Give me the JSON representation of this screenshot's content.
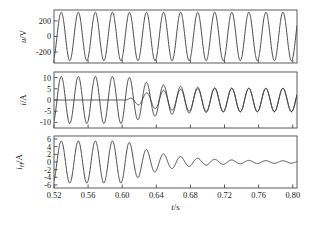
{
  "figure": {
    "background_color": "#ffffff",
    "axis_color": "#4a4a4a",
    "curve_color": "#3c3c3c",
    "text_color": "#1a1a1a",
    "xlabel": "t/s",
    "xlabel_italic": "t",
    "xlabel_rest": "/s"
  },
  "chart_data": [
    {
      "type": "line",
      "panel": 1,
      "title": "",
      "ylabel": "u/V",
      "ylabel_italic": "u",
      "ylabel_rest": "/V",
      "xlabel": "",
      "xlim": [
        0.52,
        0.805
      ],
      "ylim": [
        -340,
        340
      ],
      "yticks": [
        200,
        0,
        -200
      ],
      "ytick_labels": [
        "200",
        "0",
        "-200"
      ],
      "xticks": [
        0.52,
        0.56,
        0.6,
        0.64,
        0.68,
        0.72,
        0.76,
        0.8
      ],
      "xtick_labels": [
        "",
        "",
        "",
        "",
        "",
        "",
        "",
        ""
      ],
      "grid": false,
      "legend": null,
      "series": [
        {
          "name": "u",
          "description": "constant-amplitude 50 Hz sinusoidal supply voltage",
          "waveform": "sine",
          "amplitude": 311,
          "frequency_hz": 50,
          "phase_rad": -1.1,
          "offset": 0
        }
      ]
    },
    {
      "type": "line",
      "panel": 2,
      "title": "",
      "ylabel": "i/A",
      "ylabel_italic": "i",
      "ylabel_rest": "/A",
      "xlabel": "",
      "xlim": [
        0.52,
        0.805
      ],
      "ylim": [
        -12.5,
        12.5
      ],
      "yticks": [
        10,
        5,
        0,
        -5,
        -10
      ],
      "ytick_labels": [
        "10",
        "5",
        "0",
        "-5",
        "-10"
      ],
      "xticks": [
        0.52,
        0.56,
        0.6,
        0.64,
        0.68,
        0.72,
        0.76,
        0.8
      ],
      "xtick_labels": [
        "",
        "",
        "",
        "",
        "",
        "",
        "",
        ""
      ],
      "grid": false,
      "legend": null,
      "series": [
        {
          "name": "i-load",
          "description": "load current: 50 Hz sinusoid of amplitude 10.5 A before 0.605 s, decaying to 5.2 A afterwards",
          "waveform": "sine-decay",
          "amplitude_before": 10.5,
          "amplitude_after": 5.2,
          "switch_time": 0.605,
          "decay_tau": 0.035,
          "frequency_hz": 50,
          "phase_rad": -1.1
        },
        {
          "name": "i-compensated",
          "description": "second trace: zero until 0.605 s, then rises and converges onto the load current",
          "waveform": "zero-then-sine",
          "amplitude_zero": 0,
          "amplitude_final": 5.2,
          "switch_time": 0.605,
          "rise_tau": 0.025,
          "frequency_hz": 50,
          "phase_rad": -1.1
        }
      ]
    },
    {
      "type": "line",
      "panel": 3,
      "title": "",
      "ylabel": "iH/A",
      "ylabel_italic": "i",
      "ylabel_sub": "H",
      "ylabel_rest": "/A",
      "xlabel": "t/s",
      "xlim": [
        0.52,
        0.805
      ],
      "ylim": [
        -6.8,
        6.8
      ],
      "yticks": [
        6,
        4,
        2,
        0,
        -2,
        -4,
        -6
      ],
      "ytick_labels": [
        "6",
        "4",
        "2",
        "0",
        "-2",
        "-4",
        "-6"
      ],
      "xticks": [
        0.52,
        0.56,
        0.6,
        0.64,
        0.68,
        0.72,
        0.76,
        0.8
      ],
      "xtick_labels": [
        "0.52",
        "0.56",
        "0.60",
        "0.64",
        "0.68",
        "0.72",
        "0.76",
        "0.80"
      ],
      "grid": false,
      "legend": null,
      "series": [
        {
          "name": "iH",
          "description": "harmonic current: 50 Hz oscillation of amplitude 5.5 A until 0.605 s, then exponentially decaying toward zero",
          "waveform": "sine-decay-to-zero",
          "amplitude_before": 5.5,
          "switch_time": 0.605,
          "decay_tau": 0.042,
          "residual_amplitude": 0.25,
          "frequency_hz": 50,
          "phase_rad": -1.1
        }
      ]
    }
  ]
}
